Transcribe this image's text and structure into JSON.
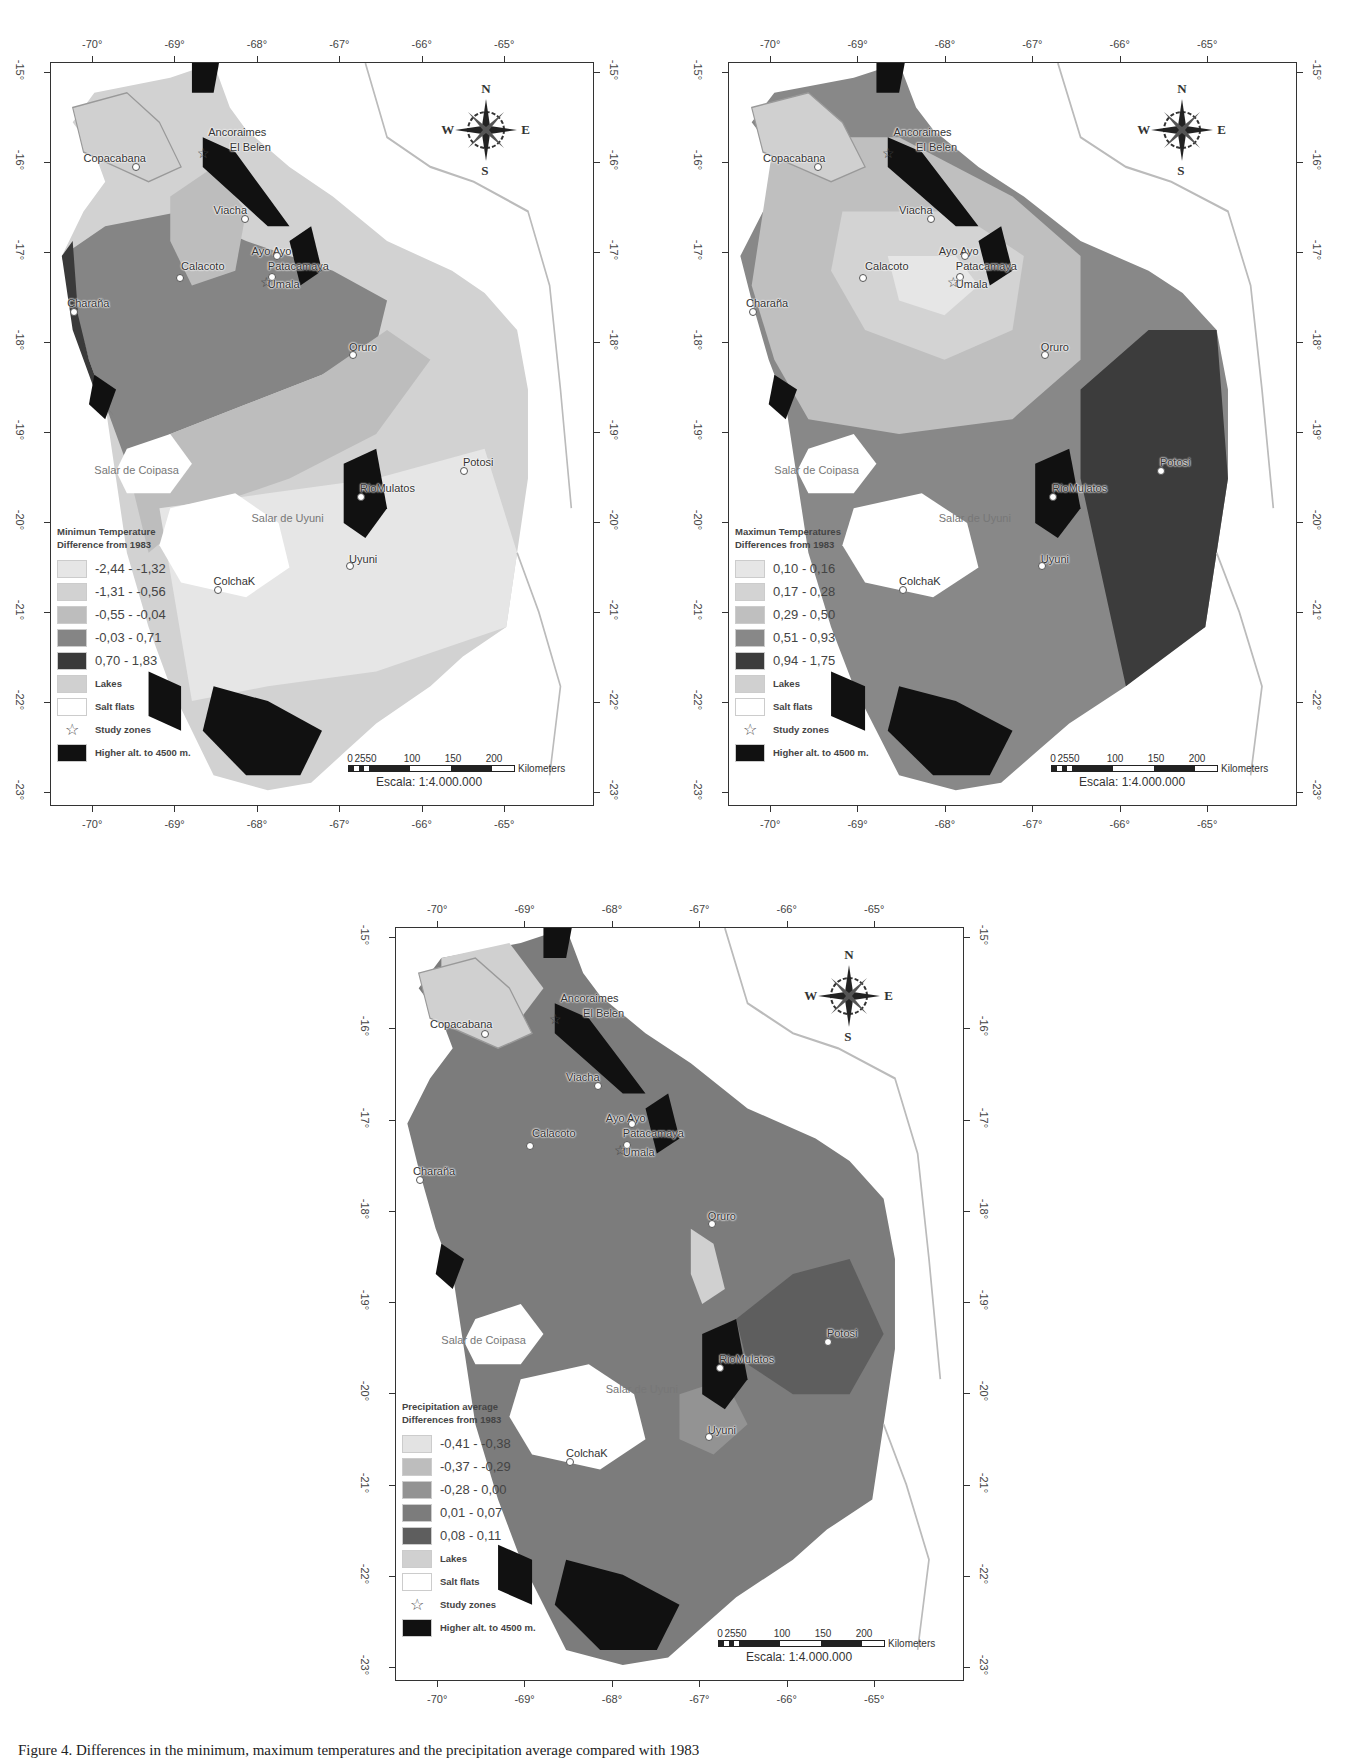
{
  "figure": {
    "caption": "Figure 4. Differences in the minimum, maximum temperatures and the precipitation average compared with 1983"
  },
  "axes": {
    "longitude_labels": [
      "-70°",
      "-69°",
      "-68°",
      "-67°",
      "-66°",
      "-65°"
    ],
    "latitude_labels": [
      "-15°",
      "-16°",
      "-17°",
      "-18°",
      "-19°",
      "-20°",
      "-21°",
      "-22°",
      "-23°"
    ]
  },
  "compass": {
    "n": "N",
    "s": "S",
    "e": "E",
    "w": "W"
  },
  "scale": {
    "ticks": [
      "0",
      "25",
      "50",
      "100",
      "150",
      "200"
    ],
    "unit": "Kilometers",
    "ratio": "Escala: 1:4.000.000"
  },
  "places": [
    {
      "name": "Ancoraimes",
      "type": "label"
    },
    {
      "name": "El Belen",
      "type": "label"
    },
    {
      "name": "Copacabana",
      "type": "town"
    },
    {
      "name": "Viacha",
      "type": "town"
    },
    {
      "name": "Ayo Ayo",
      "type": "town"
    },
    {
      "name": "Calacoto",
      "type": "town"
    },
    {
      "name": "Patacamaya",
      "type": "town"
    },
    {
      "name": "Umala",
      "type": "study-zone"
    },
    {
      "name": "Charaña",
      "type": "town"
    },
    {
      "name": "Oruro",
      "type": "town"
    },
    {
      "name": "Salar de Coipasa",
      "type": "salar"
    },
    {
      "name": "Potosi",
      "type": "town"
    },
    {
      "name": "RioMulatos",
      "type": "town"
    },
    {
      "name": "Salar de Uyuni",
      "type": "salar"
    },
    {
      "name": "Uyuni",
      "type": "town"
    },
    {
      "name": "ColchaK",
      "type": "town"
    }
  ],
  "maps": [
    {
      "id": "min-temp",
      "legend_title_1": "Minimun Temperature",
      "legend_title_2": "Difference from 1983",
      "classes": [
        {
          "label": "-2,44 - -1,32",
          "color": "#e6e6e6"
        },
        {
          "label": "-1,31 - -0,56",
          "color": "#d2d2d2"
        },
        {
          "label": "-0,55 - -0,04",
          "color": "#bdbdbd"
        },
        {
          "label": "-0,03 - 0,71",
          "color": "#858585"
        },
        {
          "label": "0,70 - 1,83",
          "color": "#3a3a3a"
        }
      ],
      "lakes_label": "Lakes",
      "salt_flats_label": "Salt flats",
      "study_zones_label": "Study zones",
      "high_alt_label": "Higher alt. to 4500 m."
    },
    {
      "id": "max-temp",
      "legend_title_1": "Maximun Temperatures",
      "legend_title_2": "Differences from 1983",
      "classes": [
        {
          "label": "0,10 - 0,16",
          "color": "#e6e6e6"
        },
        {
          "label": "0,17 - 0,28",
          "color": "#d3d3d3"
        },
        {
          "label": "0,29 - 0,50",
          "color": "#bfbfbf"
        },
        {
          "label": "0,51 - 0,93",
          "color": "#888888"
        },
        {
          "label": "0,94 - 1,75",
          "color": "#3c3c3c"
        }
      ],
      "lakes_label": "Lakes",
      "salt_flats_label": "Salt flats",
      "study_zones_label": "Study zones",
      "high_alt_label": "Higher alt. to 4500 m."
    },
    {
      "id": "precipitation",
      "legend_title_1": "Precipitation average",
      "legend_title_2": "Differences from 1983",
      "classes": [
        {
          "label": "-0,41 - -0,38",
          "color": "#e3e3e3"
        },
        {
          "label": "-0,37 - -0,29",
          "color": "#bdbdbd"
        },
        {
          "label": "-0,28 - 0,00",
          "color": "#939393"
        },
        {
          "label": "0,01 - 0,07",
          "color": "#7c7c7c"
        },
        {
          "label": "0,08 - 0,11",
          "color": "#5e5e5e"
        }
      ],
      "lakes_label": "Lakes",
      "salt_flats_label": "Salt flats",
      "study_zones_label": "Study zones",
      "high_alt_label": "Higher alt. to 4500 m."
    }
  ],
  "colors": {
    "lakes": "#d0d0d0",
    "salt_flats": "#ffffff",
    "high_alt": "#111111",
    "frame": "#333333"
  }
}
